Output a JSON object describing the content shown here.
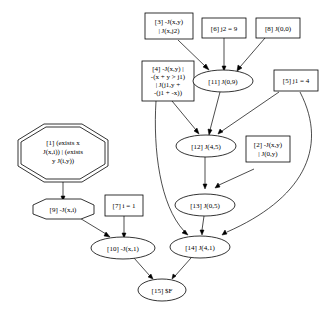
{
  "diagram": {
    "type": "proof-graph",
    "nodes": {
      "n1": {
        "id": "1",
        "shape": "doubleoctagon",
        "lines": [
          "[1] (exists x",
          "J(x,i)) | (exists",
          "y J(i,y))"
        ]
      },
      "n2": {
        "id": "2",
        "shape": "box",
        "lines": [
          "[2] -J(x,y)",
          "| J(0,y)"
        ]
      },
      "n3": {
        "id": "3",
        "shape": "box",
        "lines": [
          "[3] -J(x,y)",
          "| J(x,j2)"
        ]
      },
      "n4": {
        "id": "4",
        "shape": "box",
        "lines": [
          "[4] -J(x,y) |",
          "-(x + y > j1)",
          "| J(j1,y +",
          "-(j1 + -x))"
        ]
      },
      "n5": {
        "id": "5",
        "shape": "box",
        "lines": [
          "[5] j1 = 4"
        ]
      },
      "n6": {
        "id": "6",
        "shape": "box",
        "lines": [
          "[6] j2 = 9"
        ]
      },
      "n7": {
        "id": "7",
        "shape": "box",
        "lines": [
          "[7] i = 1"
        ]
      },
      "n8": {
        "id": "8",
        "shape": "box",
        "lines": [
          "[8] J(0,0)"
        ]
      },
      "n9": {
        "id": "9",
        "shape": "octagon",
        "lines": [
          "[9] -J(x,i)"
        ]
      },
      "n10": {
        "id": "10",
        "shape": "ellipse",
        "lines": [
          "[10] -J(x,1)"
        ]
      },
      "n11": {
        "id": "11",
        "shape": "ellipse",
        "lines": [
          "[11] J(0,9)"
        ]
      },
      "n12": {
        "id": "12",
        "shape": "ellipse",
        "lines": [
          "[12] J(4,5)"
        ]
      },
      "n13": {
        "id": "13",
        "shape": "ellipse",
        "lines": [
          "[13] J(0,5)"
        ]
      },
      "n14": {
        "id": "14",
        "shape": "ellipse",
        "lines": [
          "[14] J(4,1)"
        ]
      },
      "n15": {
        "id": "15",
        "shape": "ellipse",
        "lines": [
          "[15] $F"
        ]
      }
    },
    "edges": [
      [
        "3",
        "11"
      ],
      [
        "6",
        "11"
      ],
      [
        "8",
        "11"
      ],
      [
        "4",
        "12"
      ],
      [
        "11",
        "12"
      ],
      [
        "5",
        "12"
      ],
      [
        "12",
        "13"
      ],
      [
        "2",
        "13"
      ],
      [
        "4",
        "14"
      ],
      [
        "13",
        "14"
      ],
      [
        "5",
        "14"
      ],
      [
        "1",
        "9"
      ],
      [
        "9",
        "10"
      ],
      [
        "7",
        "10"
      ],
      [
        "10",
        "15"
      ],
      [
        "14",
        "15"
      ]
    ],
    "colors": {
      "stroke": "#000000",
      "fill": "#ffffff",
      "background": "#ffffff"
    }
  }
}
